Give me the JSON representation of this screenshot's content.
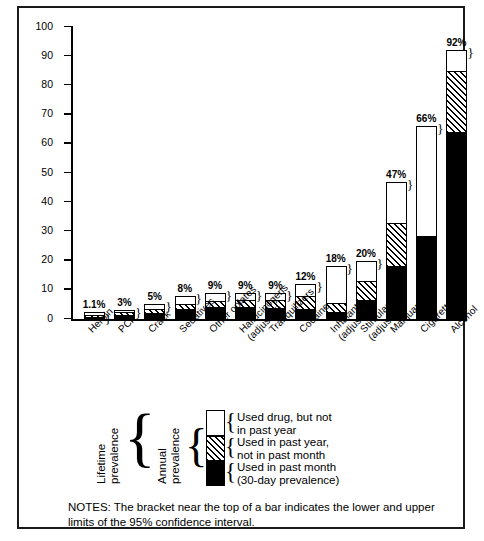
{
  "chart_data": {
    "type": "bar",
    "title": "",
    "xlabel": "",
    "ylabel": "Percentage, Class of 1988",
    "ylim": [
      0,
      100
    ],
    "yticks": [
      0,
      10,
      20,
      30,
      40,
      50,
      60,
      70,
      80,
      90,
      100
    ],
    "grid": false,
    "stacked": true,
    "legend_position": "bottom-left",
    "categories": [
      "Heroin",
      "PCP",
      "Crack",
      "Sedatives",
      "Other opiates",
      "Hallucinogens\n(adjusted)",
      "Tranquilizers",
      "Cocaine",
      "Inhalants\n(adjusted)",
      "Stimulants\n(adjusted)",
      "Marijuana",
      "Cigarettes",
      "Alcohol"
    ],
    "series": [
      {
        "name": "Used in past month (30-day prevalence)",
        "fill": "black",
        "values": [
          0.2,
          1.5,
          2.0,
          3.3,
          4.0,
          4.0,
          3.8,
          3.5,
          2.5,
          6.5,
          18.0,
          28.5,
          64.0
        ]
      },
      {
        "name": "Used in past year, not in past month",
        "fill": "hatched",
        "values": [
          0.3,
          0.6,
          1.3,
          1.9,
          2.3,
          2.6,
          2.6,
          4.5,
          3.0,
          6.5,
          15.0,
          0.0,
          21.0
        ]
      },
      {
        "name": "Used drug, but not in past year",
        "fill": "white",
        "values": [
          0.6,
          0.9,
          1.7,
          2.8,
          2.7,
          2.4,
          2.6,
          4.0,
          12.5,
          7.0,
          14.0,
          37.5,
          7.0
        ]
      }
    ],
    "total_labels": [
      "1.1%",
      "3%",
      "5%",
      "8%",
      "9%",
      "9%",
      "9%",
      "12%",
      "18%",
      "20%",
      "47%",
      "66%",
      "92%"
    ],
    "totals": [
      1.1,
      3,
      5,
      8,
      9,
      9,
      9,
      12,
      18,
      20,
      47,
      66,
      92
    ],
    "annotation": "Brackets at the top of each bar show the 95% confidence interval."
  },
  "legend": {
    "bracket_symbol": "}",
    "lifetime_label": "Lifetime\nprevalence",
    "annual_label": "Annual\nprevalence",
    "items": [
      {
        "swatch": "white",
        "text": "Used drug, but not\nin past year"
      },
      {
        "swatch": "hatched",
        "text": "Used in past year,\nnot in past month"
      },
      {
        "swatch": "black",
        "text": "Used in past month\n(30-day prevalence)"
      }
    ]
  },
  "notes": {
    "text": "NOTES: The bracket near the top of a bar indicates the lower and upper limits of the 95% confidence interval."
  },
  "colors": {
    "ink": "#000000",
    "paper": "#ffffff",
    "frame": "#1a1a1a"
  }
}
